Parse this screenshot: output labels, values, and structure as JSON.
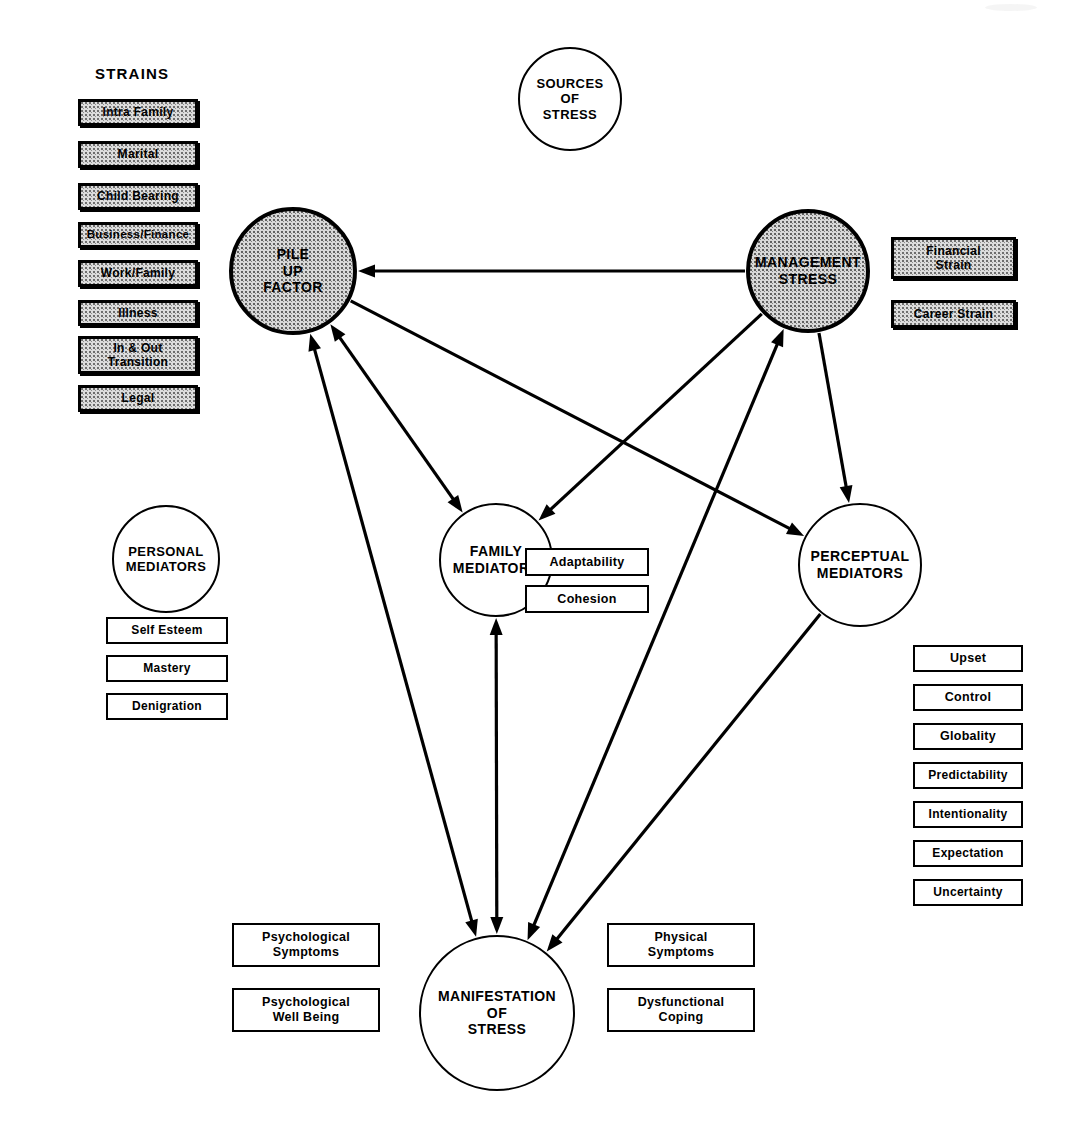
{
  "figure": {
    "type": "flow-diagram",
    "background": "#ffffff",
    "ink": "#000000",
    "shade": "#dcdcdc"
  },
  "group_titles": {
    "strains": "STRAINS"
  },
  "nodes": [
    {
      "id": "sources",
      "label": "SOURCES\nOF\nSTRESS",
      "style": "plain",
      "cx": 570,
      "cy": 99,
      "r": 52,
      "font": 13
    },
    {
      "id": "pileup",
      "label": "PILE\nUP\nFACTOR",
      "style": "shaded",
      "cx": 293,
      "cy": 271,
      "r": 64,
      "font": 14
    },
    {
      "id": "management",
      "label": "MANAGEMENT\nSTRESS",
      "style": "shaded",
      "cx": 808,
      "cy": 271,
      "r": 62,
      "font": 14
    },
    {
      "id": "personal",
      "label": "PERSONAL\nMEDIATORS",
      "style": "plain",
      "cx": 166,
      "cy": 559,
      "r": 54,
      "font": 13
    },
    {
      "id": "family",
      "label": "FAMILY\nMEDIATORS",
      "style": "plain",
      "cx": 496,
      "cy": 560,
      "r": 57,
      "font": 14
    },
    {
      "id": "perceptual",
      "label": "PERCEPTUAL\nMEDIATORS",
      "style": "plain",
      "cx": 860,
      "cy": 565,
      "r": 62,
      "font": 14
    },
    {
      "id": "manifestation",
      "label": "MANIFESTATION\nOF\nSTRESS",
      "style": "plain",
      "cx": 497,
      "cy": 1013,
      "r": 78,
      "font": 14
    }
  ],
  "boxes": [
    {
      "id": "intra-family",
      "label": "Intra  Family",
      "style": "shaded",
      "x": 78,
      "y": 99,
      "w": 120,
      "h": 27,
      "font": 12
    },
    {
      "id": "marital",
      "label": "Marital",
      "style": "shaded",
      "x": 78,
      "y": 141,
      "w": 120,
      "h": 27,
      "font": 12
    },
    {
      "id": "child-bearing",
      "label": "Child  Bearing",
      "style": "shaded",
      "x": 78,
      "y": 183,
      "w": 120,
      "h": 27,
      "font": 12
    },
    {
      "id": "business-finance",
      "label": "Business/Finance",
      "style": "shaded",
      "x": 78,
      "y": 222,
      "w": 120,
      "h": 26,
      "font": 11.5
    },
    {
      "id": "work-family",
      "label": "Work/Family",
      "style": "shaded",
      "x": 78,
      "y": 260,
      "w": 120,
      "h": 27,
      "font": 12
    },
    {
      "id": "illness",
      "label": "Illness",
      "style": "shaded",
      "x": 78,
      "y": 300,
      "w": 120,
      "h": 26,
      "font": 12
    },
    {
      "id": "in-out-transition",
      "label": "In & Out\nTransition",
      "style": "shaded",
      "x": 78,
      "y": 336,
      "w": 120,
      "h": 38,
      "font": 12
    },
    {
      "id": "legal",
      "label": "Legal",
      "style": "shaded",
      "x": 78,
      "y": 385,
      "w": 120,
      "h": 27,
      "font": 12
    },
    {
      "id": "financial-strain",
      "label": "Financial\nStrain",
      "style": "shaded",
      "x": 891,
      "y": 237,
      "w": 125,
      "h": 42,
      "font": 12
    },
    {
      "id": "career-strain",
      "label": "Career  Strain",
      "style": "shaded",
      "x": 891,
      "y": 300,
      "w": 125,
      "h": 28,
      "font": 12
    },
    {
      "id": "self-esteem",
      "label": "Self   Esteem",
      "style": "plain",
      "x": 106,
      "y": 617,
      "w": 122,
      "h": 27,
      "font": 12
    },
    {
      "id": "mastery",
      "label": "Mastery",
      "style": "plain",
      "x": 106,
      "y": 655,
      "w": 122,
      "h": 27,
      "font": 12
    },
    {
      "id": "denigration",
      "label": "Denigration",
      "style": "plain",
      "x": 106,
      "y": 693,
      "w": 122,
      "h": 27,
      "font": 12
    },
    {
      "id": "adaptability",
      "label": "Adaptability",
      "style": "plain",
      "x": 525,
      "y": 548,
      "w": 124,
      "h": 28,
      "font": 12.5
    },
    {
      "id": "cohesion",
      "label": "Cohesion",
      "style": "plain",
      "x": 525,
      "y": 585,
      "w": 124,
      "h": 28,
      "font": 12.5
    },
    {
      "id": "upset",
      "label": "Upset",
      "style": "plain",
      "x": 913,
      "y": 645,
      "w": 110,
      "h": 27,
      "font": 12.5
    },
    {
      "id": "control",
      "label": "Control",
      "style": "plain",
      "x": 913,
      "y": 684,
      "w": 110,
      "h": 27,
      "font": 12.5
    },
    {
      "id": "globality",
      "label": "Globality",
      "style": "plain",
      "x": 913,
      "y": 723,
      "w": 110,
      "h": 27,
      "font": 12.5
    },
    {
      "id": "predictability",
      "label": "Predictability",
      "style": "plain",
      "x": 913,
      "y": 762,
      "w": 110,
      "h": 27,
      "font": 12
    },
    {
      "id": "intentionality",
      "label": "Intentionality",
      "style": "plain",
      "x": 913,
      "y": 801,
      "w": 110,
      "h": 27,
      "font": 12
    },
    {
      "id": "expectation",
      "label": "Expectation",
      "style": "plain",
      "x": 913,
      "y": 840,
      "w": 110,
      "h": 27,
      "font": 12
    },
    {
      "id": "uncertainty",
      "label": "Uncertainty",
      "style": "plain",
      "x": 913,
      "y": 879,
      "w": 110,
      "h": 27,
      "font": 12
    },
    {
      "id": "psychological-symptoms",
      "label": "Psychological\nSymptoms",
      "style": "plain",
      "x": 232,
      "y": 923,
      "w": 148,
      "h": 44,
      "font": 12.5
    },
    {
      "id": "psychological-wellbeing",
      "label": "Psychological\nWell  Being",
      "style": "plain",
      "x": 232,
      "y": 988,
      "w": 148,
      "h": 44,
      "font": 12.5
    },
    {
      "id": "physical-symptoms",
      "label": "Physical\nSymptoms",
      "style": "plain",
      "x": 607,
      "y": 923,
      "w": 148,
      "h": 44,
      "font": 12.5
    },
    {
      "id": "dysfunctional-coping",
      "label": "Dysfunctional\nCoping",
      "style": "plain",
      "x": 607,
      "y": 988,
      "w": 148,
      "h": 44,
      "font": 12.5
    }
  ],
  "edges": [
    {
      "id": "management-to-pileup",
      "from": "management",
      "to": "pileup",
      "arrows": "end"
    },
    {
      "id": "pileup-to-family",
      "from": "pileup",
      "to": "family",
      "arrows": "both"
    },
    {
      "id": "pileup-to-perceptual",
      "from": "pileup",
      "to": "perceptual",
      "arrows": "end"
    },
    {
      "id": "management-to-family",
      "from": "management",
      "to": "family",
      "arrows": "end"
    },
    {
      "id": "management-to-perceptual",
      "from": "management",
      "to": "perceptual",
      "arrows": "end"
    },
    {
      "id": "manifestation-to-pileup-left",
      "from": "manifestation",
      "to": "pileup",
      "arrows": "both"
    },
    {
      "id": "manifestation-to-management",
      "from": "manifestation",
      "to": "management",
      "arrows": "both"
    },
    {
      "id": "family-to-manifestation",
      "from": "family",
      "to": "manifestation",
      "arrows": "both"
    },
    {
      "id": "perceptual-to-manifestation",
      "from": "perceptual",
      "to": "manifestation",
      "arrows": "end"
    }
  ]
}
